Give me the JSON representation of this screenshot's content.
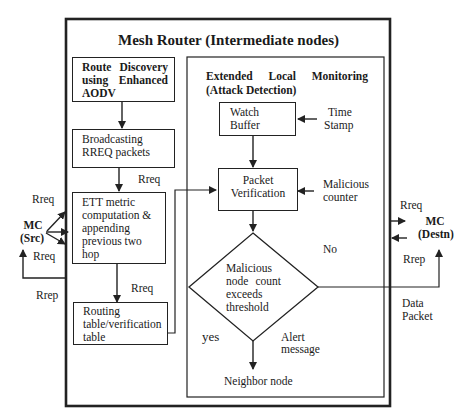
{
  "diagram": {
    "title": "Mesh Router (Intermediate nodes)",
    "left_column": {
      "route_discovery": {
        "line1a": "Route",
        "line1b": "Discovery",
        "line2a": "using",
        "line2b": "Enhanced",
        "line3": "AODV"
      },
      "broadcasting": {
        "line1": "Broadcasting",
        "line2": "RREQ packets"
      },
      "ett": {
        "line1": "ETT metric",
        "line2": "computation &",
        "line3": "appending",
        "line4": "previous two",
        "line5": "hop"
      },
      "routing_table": {
        "line1": "Routing",
        "line2": "table/verification",
        "line3": "table"
      }
    },
    "monitor": {
      "header_a": "Extended",
      "header_b": "Local",
      "header_c": "Monitoring",
      "header_line2": "(Attack Detection)",
      "watch_buffer": {
        "line1": "Watch",
        "line2": "Buffer"
      },
      "time_stamp": {
        "line1": "Time",
        "line2": "Stamp"
      },
      "packet_verification": {
        "line1": "Packet",
        "line2": "Verification"
      },
      "malicious_counter": {
        "line1": "Malicious",
        "line2": "counter"
      },
      "decision": {
        "line1": "Malicious",
        "line2a": "node",
        "line2b": "count",
        "line3": "exceeds",
        "line4": "threshold"
      },
      "no_label": "No",
      "yes_label": "yes",
      "alert": {
        "line1": "Alert",
        "line2": "message"
      },
      "neighbor": "Neighbor node"
    },
    "source": {
      "line1": "MC",
      "line2": "(Src)"
    },
    "destination": {
      "line1": "MC",
      "line2": "(Destn)"
    },
    "edge_labels": {
      "rreq_broadcast": "Rreq",
      "rreq_ett_out": "Rreq",
      "rreq_src_top": "Rreq",
      "rreq_src_bottom": "Rreq",
      "rrep_src": "Rrep",
      "rreq_dest": "Rreq",
      "rrep_dest": "Rrep",
      "data_packet_1": "Data",
      "data_packet_2": "Packet"
    }
  }
}
